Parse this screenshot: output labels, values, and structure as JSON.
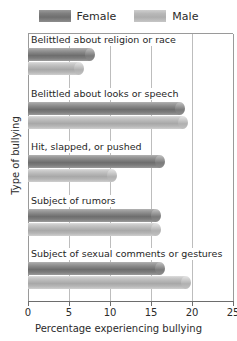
{
  "chart_data": {
    "type": "bar",
    "orientation": "horizontal",
    "title": "",
    "xlabel": "Percentage experiencing bullying",
    "ylabel": "Type of bullying",
    "xlim": [
      0,
      25
    ],
    "xticks": [
      0,
      5,
      10,
      15,
      20,
      25
    ],
    "xtick_labels": [
      "0",
      "5",
      "10",
      "15",
      "20",
      "25"
    ],
    "grid": true,
    "legend_position": "top",
    "categories": [
      "Belittled about religion or race",
      "Belittled about looks or speech",
      "Hit, slapped, or pushed",
      "Subject of rumors",
      "Subject of sexual comments or gestures"
    ],
    "series": [
      {
        "name": "Female",
        "color": "#7e7e7e",
        "values": [
          8.2,
          19.2,
          16.7,
          16.2,
          16.7
        ]
      },
      {
        "name": "Male",
        "color": "#b8b8b8",
        "values": [
          6.8,
          19.5,
          10.8,
          16.2,
          19.9
        ]
      }
    ]
  },
  "legend": {
    "entries": [
      {
        "label": "Female",
        "swatch": "female-swatch"
      },
      {
        "label": "Male",
        "swatch": "male-swatch"
      }
    ]
  },
  "axes": {
    "x_axis_label": "Percentage experiencing bullying",
    "y_axis_label": "Type of bullying"
  }
}
